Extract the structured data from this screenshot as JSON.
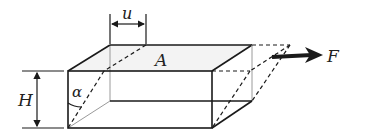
{
  "diagram": {
    "labels": {
      "displacement": "u",
      "area": "A",
      "force": "F",
      "height": "H",
      "angle": "α"
    },
    "colors": {
      "line": "#1a1a1a",
      "faint": "#888888",
      "fill_top": "#f2f2f2",
      "background": "#ffffff"
    }
  }
}
